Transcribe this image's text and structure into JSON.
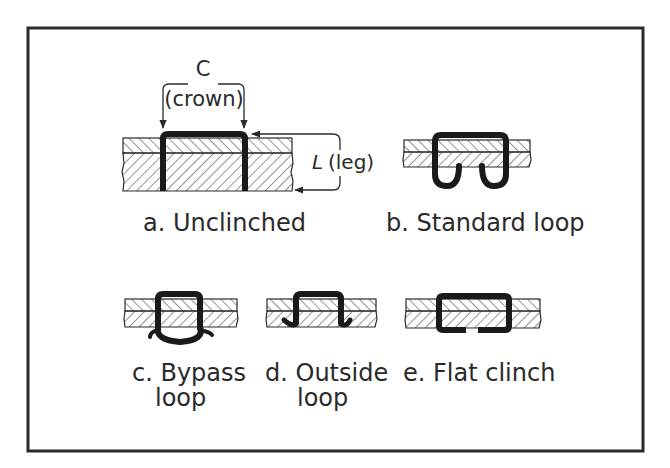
{
  "figure": {
    "frame": {
      "stroke": "#2b2b2b"
    },
    "colors": {
      "ink": "#1a1a1a",
      "hatch": "#3a3a3a",
      "text": "#2a2a2a",
      "background": "#ffffff"
    },
    "dimensions": {
      "crown_symbol": "C",
      "crown_label": "(crown)",
      "leg_symbol": "L",
      "leg_label": "(leg)"
    },
    "panels": [
      {
        "id": "a",
        "caption_line1": "a. Unclinched",
        "caption_line2": ""
      },
      {
        "id": "b",
        "caption_line1": "b. Standard loop",
        "caption_line2": ""
      },
      {
        "id": "c",
        "caption_line1": "c. Bypass",
        "caption_line2": "loop"
      },
      {
        "id": "d",
        "caption_line1": "d. Outside",
        "caption_line2": "loop"
      },
      {
        "id": "e",
        "caption_line1": "e. Flat clinch",
        "caption_line2": ""
      }
    ]
  }
}
